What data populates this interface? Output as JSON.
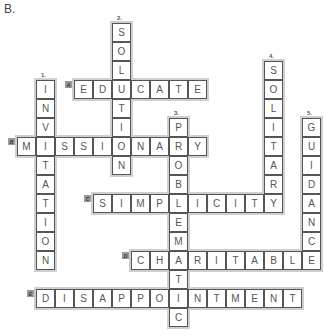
{
  "title": "B.",
  "grid": {
    "origin_x": 17,
    "origin_y": 23,
    "cell": 19
  },
  "words": [
    {
      "label": "A.",
      "style": "box",
      "answer": "EDUCATE",
      "dir": "across",
      "col": 3,
      "row": 3
    },
    {
      "label": "B.",
      "style": "box",
      "answer": "MISSIONARY",
      "dir": "across",
      "col": 0,
      "row": 6
    },
    {
      "label": "C.",
      "style": "box",
      "answer": "SIMPLICITY",
      "dir": "across",
      "col": 4,
      "row": 9
    },
    {
      "label": "D.",
      "style": "box",
      "answer": "CHARITABLE",
      "dir": "across",
      "col": 6,
      "row": 12
    },
    {
      "label": "E.",
      "style": "box",
      "answer": "DISAPPOINTMENT",
      "dir": "across",
      "col": 1,
      "row": 14
    },
    {
      "label": "1.",
      "style": "num",
      "answer": "INVITATION",
      "dir": "down",
      "col": 1,
      "row": 3
    },
    {
      "label": "2.",
      "style": "num",
      "answer": "SOLUTION",
      "dir": "down",
      "col": 5,
      "row": 0
    },
    {
      "label": "3.",
      "style": "num",
      "answer": "PROBLEMATIC",
      "dir": "down",
      "col": 8,
      "row": 5
    },
    {
      "label": "4.",
      "style": "num",
      "answer": "SOLITARY",
      "dir": "down",
      "col": 13,
      "row": 2
    },
    {
      "label": "5.",
      "style": "num",
      "answer": "GUIDANCE",
      "dir": "down",
      "col": 15,
      "row": 5
    }
  ]
}
